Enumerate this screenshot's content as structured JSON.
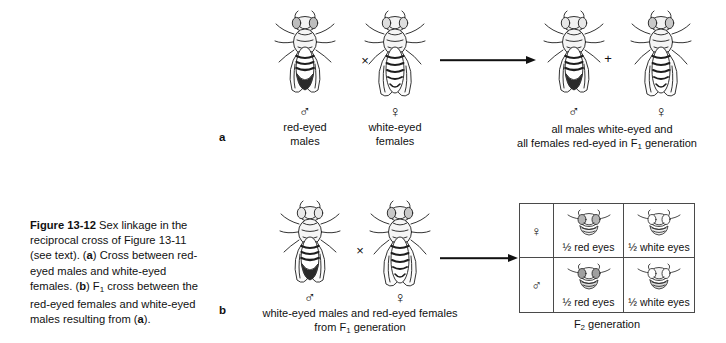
{
  "figure": {
    "number": "Figure 13-12",
    "caption_text": " Sex linkage in the reciprocal cross of Figure 13-11 (see text). (a) Cross between red-eyed males and white-eyed females. (b) F1 cross between the red-eyed females and white-eyed males resulting from (a).",
    "caption_part1": " Sex linkage in the reciprocal cross of Figure 13-11 (see text). (",
    "caption_a_marker": "a",
    "caption_part2": ") Cross between red-eyed males and white-eyed females. (",
    "caption_b_marker": "b",
    "caption_part3": ") F",
    "caption_f1_sub": "1",
    "caption_part4": " cross between the red-eyed females and white-eyed males resulting from (",
    "caption_a_marker2": "a",
    "caption_part5": ")."
  },
  "panel_a": {
    "letter": "a",
    "parent_male": {
      "sex_symbol": "♂",
      "label_line1": "red-eyed",
      "label_line2": "males"
    },
    "cross_operator": "×",
    "parent_female": {
      "sex_symbol": "♀",
      "label_line1": "white-eyed",
      "label_line2": "females"
    },
    "offspring_male_symbol": "♂",
    "plus_operator": "+",
    "offspring_female_symbol": "♀",
    "offspring_text_line1": "all males white-eyed and",
    "offspring_text_line2_pre": "all females red-eyed in F",
    "offspring_text_line2_sub": "1",
    "offspring_text_line2_post": " generation"
  },
  "panel_b": {
    "letter": "b",
    "parent_male_symbol": "♂",
    "cross_operator": "×",
    "parent_female_symbol": "♀",
    "parents_text_line1": "white-eyed males  and  red-eyed females",
    "parents_text_line2_pre": "from F",
    "parents_text_line2_sub": "1",
    "parents_text_line2_post": " generation",
    "punnett": {
      "rows": [
        {
          "sex_symbol": "♀",
          "cells": [
            {
              "label": "½ red eyes"
            },
            {
              "label": "½ white eyes"
            }
          ]
        },
        {
          "sex_symbol": "♂",
          "cells": [
            {
              "label": "½ red eyes"
            },
            {
              "label": "½ white eyes"
            }
          ]
        }
      ]
    },
    "f2_caption_pre": "F",
    "f2_caption_sub": "2",
    "f2_caption_post": " generation"
  },
  "icons": {
    "fly": "drosophila-fly-icon",
    "arrow": "right-arrow-icon"
  },
  "colors": {
    "ink": "#111111",
    "grid_line": "#4a4a4a",
    "background": "#ffffff"
  }
}
